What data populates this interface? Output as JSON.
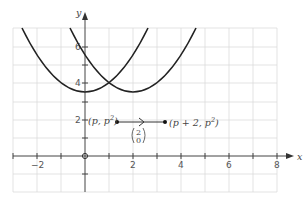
{
  "axes": {
    "x_label": "x",
    "y_label": "y",
    "x_ticks": [
      {
        "value": -2,
        "label": "−2"
      },
      {
        "value": 2,
        "label": "2"
      },
      {
        "value": 4,
        "label": "4"
      },
      {
        "value": 6,
        "label": "6"
      },
      {
        "value": 8,
        "label": "8"
      }
    ],
    "y_ticks": [
      {
        "value": 2,
        "label": "2"
      },
      {
        "value": 4,
        "label": "4"
      },
      {
        "value": 6,
        "label": "6"
      }
    ],
    "x_range": [
      -3,
      8
    ],
    "y_range": [
      -2,
      7
    ]
  },
  "curves": [
    {
      "name": "y = x^2",
      "vertex": [
        0,
        0
      ]
    },
    {
      "name": "y = (x - 2)^2",
      "vertex": [
        2,
        0
      ]
    }
  ],
  "points": {
    "p_label": "(p, p",
    "p_sup": "2",
    "p_close": ")",
    "q_label": "(p + 2, p",
    "q_sup": "2",
    "q_close": ")"
  },
  "translation_vector": {
    "top": "2",
    "bottom": "0"
  },
  "colors": {
    "grid": "#dddddd",
    "axis": "#444444",
    "curve": "#222222"
  }
}
